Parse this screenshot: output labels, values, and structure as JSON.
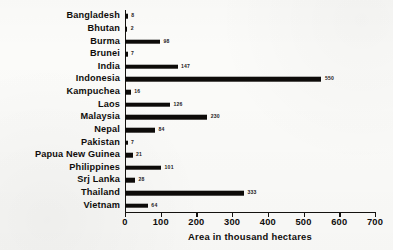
{
  "chart_data": {
    "type": "bar",
    "orientation": "horizontal",
    "title": "",
    "xlabel": "Area in thousand hectares",
    "ylabel": "",
    "xlim": [
      0,
      700
    ],
    "xticks": [
      0,
      100,
      200,
      300,
      400,
      500,
      600,
      700
    ],
    "grid": false,
    "legend": null,
    "categories": [
      "Bangladesh",
      "Bhutan",
      "Burma",
      "Brunei",
      "India",
      "Indonesia",
      "Kampuchea",
      "Laos",
      "Malaysia",
      "Nepal",
      "Pakistan",
      "Papua New Guinea",
      "Philippines",
      "Srj Lanka",
      "Thailand",
      "Vietnam"
    ],
    "values": [
      8,
      2,
      98,
      7,
      147,
      550,
      16,
      126,
      230,
      84,
      7,
      21,
      101,
      28,
      333,
      64
    ],
    "value_labels": [
      "8",
      "2",
      "98",
      "7",
      "147",
      "550",
      "16",
      "126",
      "230",
      "84",
      "7",
      "21",
      "101",
      "28",
      "333",
      "64"
    ],
    "bar_color": "#0d0b09",
    "background_color": "#fbfbf9"
  },
  "axis": {
    "x_title": "Area in thousand hectares",
    "tick_labels": [
      "0",
      "100",
      "200",
      "300",
      "400",
      "500",
      "600",
      "700"
    ]
  }
}
